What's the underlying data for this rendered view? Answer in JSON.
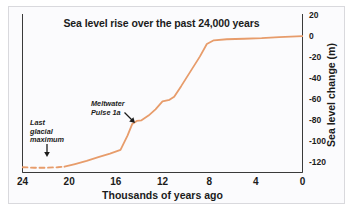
{
  "figure": {
    "title": "Sea level rise over the past 24,000 years",
    "background": "#fbfbfd",
    "frame_color": "#d9d9dd",
    "curve_color": "#E79C6B"
  },
  "annotations": [
    {
      "name": "last-glacial-maximum",
      "text": "Last\nglacial\nmaximum",
      "arrow": "down"
    },
    {
      "name": "meltwater-pulse-1a",
      "text": "Meltwater\nPulse 1a",
      "arrow": "down-right"
    }
  ],
  "chart_data": {
    "type": "line",
    "title": "Sea level rise over the past 24,000 years",
    "xlabel": "Thousands of years ago",
    "ylabel": "Sea level change (m)",
    "xlim": [
      24,
      0
    ],
    "ylim": [
      -130,
      20
    ],
    "x_reversed": true,
    "grid": false,
    "legend": "none",
    "xticks": [
      24,
      20,
      16,
      12,
      8,
      4,
      0
    ],
    "xtick_labels": [
      "24",
      "20",
      "16",
      "12",
      "8",
      "4",
      "0"
    ],
    "x_minor_tick_step": 2,
    "yticks": [
      20,
      0,
      -20,
      -40,
      -60,
      -80,
      -100,
      -120
    ],
    "ytick_labels": [
      "20",
      "0",
      "-20",
      "-40",
      "-60",
      "-80",
      "-100",
      "-120"
    ],
    "y_minor_tick_step": 10,
    "series": [
      {
        "name": "Sea level change",
        "color": "#E79C6B",
        "style": "dashed",
        "segment": "inferred",
        "x": [
          24.0,
          23.0,
          22.0,
          21.0,
          20.4
        ],
        "y": [
          -125.0,
          -125.5,
          -125.5,
          -125.0,
          -124.5
        ]
      },
      {
        "name": "Sea level change",
        "color": "#E79C6B",
        "style": "solid",
        "segment": "measured",
        "x": [
          20.4,
          19.5,
          18.5,
          17.5,
          16.5,
          15.6,
          15.0,
          14.6,
          14.2,
          13.8,
          13.2,
          12.6,
          12.0,
          11.4,
          11.0,
          10.4,
          9.6,
          8.8,
          8.2,
          7.6,
          6.5,
          5.0,
          3.5,
          2.0,
          0.0
        ],
        "y": [
          -124.5,
          -122.0,
          -119.0,
          -115.5,
          -112.0,
          -108.5,
          -95.0,
          -84.0,
          -81.0,
          -80.5,
          -76.0,
          -70.0,
          -62.5,
          -61.0,
          -58.0,
          -48.0,
          -34.0,
          -20.0,
          -8.0,
          -4.5,
          -3.5,
          -3.0,
          -2.5,
          -1.5,
          -0.5
        ]
      }
    ],
    "annotations": [
      {
        "label": "Last glacial maximum",
        "x": 22.0,
        "y": -125.0
      },
      {
        "label": "Meltwater Pulse 1a",
        "x": 14.6,
        "y": -90.0
      }
    ]
  },
  "axes": {
    "xlabel": "Thousands of years ago",
    "ylabel": "Sea level change (m)",
    "xticks": [
      "24",
      "20",
      "16",
      "12",
      "8",
      "4",
      "0"
    ],
    "yticks": [
      "20",
      "0",
      "-20",
      "-40",
      "-60",
      "-80",
      "-100",
      "-120"
    ]
  }
}
